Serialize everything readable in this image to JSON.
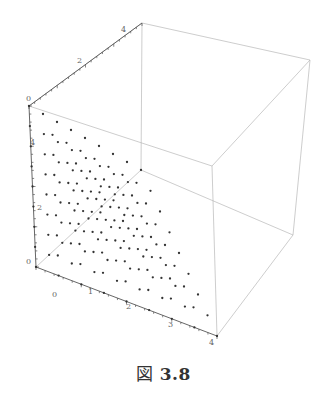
{
  "caption": {
    "prefix": "図",
    "number": "3.8"
  },
  "chart_data": {
    "type": "scatter",
    "dimension": "3d",
    "title": "",
    "axes": {
      "x": {
        "ticks": [
          "0",
          "1",
          "2",
          "3",
          "4"
        ],
        "range": [
          0,
          4
        ]
      },
      "y": {
        "ticks": [
          "0",
          "2",
          "4"
        ],
        "range": [
          0,
          4
        ]
      },
      "z": {
        "ticks": [
          "0",
          "2",
          "4"
        ],
        "range": [
          0,
          4
        ]
      }
    },
    "box": true,
    "grid": false,
    "legend": null,
    "colors": {
      "points": "#333333",
      "box": "#b0b0b0",
      "axis": "#555555"
    }
  },
  "labels": {
    "x0": "0",
    "x1": "1",
    "x2": "2",
    "x3": "3",
    "x4": "4",
    "y0": "0",
    "y2": "2",
    "y4": "4",
    "z0": "0",
    "z2": "2",
    "z4": "4"
  }
}
